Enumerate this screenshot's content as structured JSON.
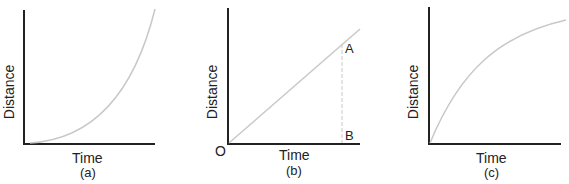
{
  "figure": {
    "panels": [
      {
        "id": "a",
        "caption": "(a)",
        "xlabel": "Time",
        "ylabel": "Distance",
        "curve": "accelerating (concave up, exponential-like)"
      },
      {
        "id": "b",
        "caption": "(b)",
        "xlabel": "Time",
        "ylabel": "Distance",
        "curve": "straight line (uniform speed)",
        "origin_label": "O",
        "point_a": "A",
        "point_b": "B"
      },
      {
        "id": "c",
        "caption": "(c)",
        "xlabel": "Time",
        "ylabel": "Distance",
        "curve": "decelerating (concave down)"
      }
    ],
    "colors": {
      "axis": "#222222",
      "curve": "#c8c8c8",
      "dashed": "#c8c8c8"
    }
  }
}
